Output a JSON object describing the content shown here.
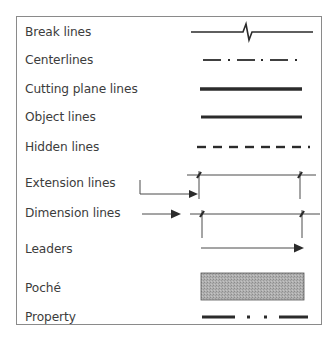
{
  "figure": {
    "rows": [
      {
        "id": "break",
        "label": "Break lines",
        "y": 32
      },
      {
        "id": "center",
        "label": "Centerlines",
        "y": 60
      },
      {
        "id": "cutting",
        "label": "Cutting plane lines",
        "y": 89
      },
      {
        "id": "object",
        "label": "Object lines",
        "y": 117
      },
      {
        "id": "hidden",
        "label": "Hidden lines",
        "y": 147
      },
      {
        "id": "extension",
        "label": "Extension lines",
        "y": 183
      },
      {
        "id": "dimension",
        "label": "Dimension lines",
        "y": 213
      },
      {
        "id": "leaders",
        "label": "Leaders",
        "y": 249
      },
      {
        "id": "poche",
        "label": "Poché",
        "y": 288
      },
      {
        "id": "property",
        "label": "Property",
        "y": 317
      }
    ],
    "caption": "",
    "colors": {
      "line": "#2b2b2b",
      "thin_line": "#4a4a4a",
      "poche_fill": "#a9a9a9",
      "frame": "#8a8a8a"
    }
  }
}
